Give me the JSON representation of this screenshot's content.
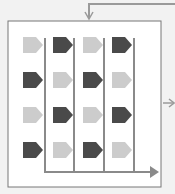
{
  "diagram": {
    "colors": {
      "background": "#f2f2f2",
      "box_fill": "#ffffff",
      "box_border": "#777777",
      "line": "#8a8a8a",
      "light_tag": "#cccccc",
      "dark_tag": "#4a4a4a"
    },
    "grid": {
      "rows": [
        [
          "light",
          "dark",
          "light",
          "dark"
        ],
        [
          "dark",
          "light",
          "dark",
          "light"
        ],
        [
          "light",
          "dark",
          "light",
          "dark"
        ],
        [
          "dark",
          "light",
          "dark",
          "light"
        ]
      ]
    },
    "arrows": [
      "input-top",
      "output-right",
      "merge-bottom"
    ]
  }
}
